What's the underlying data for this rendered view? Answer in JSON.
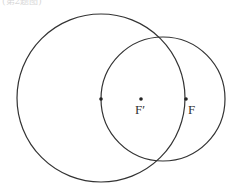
{
  "header": {
    "text": "(第2题图)"
  },
  "diagram": {
    "type": "geometry",
    "stroke_color": "#333333",
    "circles": [
      {
        "name": "large-circle",
        "cx": 101,
        "cy": 98,
        "r": 84
      },
      {
        "name": "small-circle",
        "cx": 163,
        "cy": 99,
        "r": 62
      }
    ],
    "points": [
      {
        "name": "left-intersection-point",
        "x": 101,
        "y": 99,
        "label": ""
      },
      {
        "name": "point-f-prime",
        "x": 141,
        "y": 99,
        "label": "F′"
      },
      {
        "name": "point-f",
        "x": 186,
        "y": 99,
        "label": "F"
      }
    ],
    "labels": {
      "f_prime": "F′",
      "f": "F"
    }
  }
}
